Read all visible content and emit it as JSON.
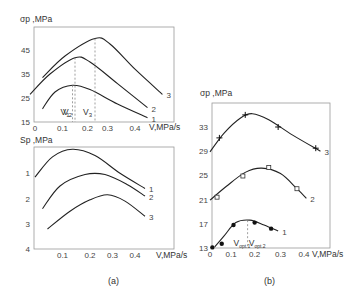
{
  "chart_data": [
    {
      "type": "line",
      "panel": "a-top",
      "ylabel": "σp ,MPa",
      "xlabel": "V,MPa/s",
      "xlim": [
        0,
        0.4
      ],
      "ylim": [
        15,
        45
      ],
      "xticks": [
        "0",
        "0.1",
        "0.2",
        "0.3",
        "0.4"
      ],
      "yticks": [
        "45",
        "35",
        "25",
        "15"
      ],
      "series": [
        {
          "name": "1",
          "points": [
            [
              0.03,
              20.5
            ],
            [
              0.08,
              27.5
            ],
            [
              0.15,
              30.3
            ],
            [
              0.22,
              28.5
            ],
            [
              0.33,
              22.5
            ],
            [
              0.45,
              16.8
            ]
          ]
        },
        {
          "name": "2",
          "points": [
            [
              -0.02,
              26.5
            ],
            [
              0.06,
              35
            ],
            [
              0.16,
              41.8
            ],
            [
              0.22,
              40
            ],
            [
              0.33,
              31
            ],
            [
              0.45,
              21
            ]
          ]
        },
        {
          "name": "3",
          "points": [
            [
              0.03,
              33.5
            ],
            [
              0.12,
              42.5
            ],
            [
              0.24,
              49.8
            ],
            [
              0.3,
              47.5
            ],
            [
              0.4,
              37
            ],
            [
              0.51,
              26.5
            ]
          ]
        }
      ],
      "annotations": [
        {
          "text": "V1",
          "x": 0.13
        },
        {
          "text": "V2",
          "x": 0.21
        },
        {
          "text": "V3",
          "x": 0.25
        }
      ]
    },
    {
      "type": "line",
      "panel": "a-bottom",
      "ylabel": "Sp ,MPa",
      "xlabel": "V,MPa/s",
      "xlim": [
        0,
        0.4
      ],
      "ylim": [
        0,
        4
      ],
      "y_inverted": true,
      "xticks": [
        "0.1",
        "0.2",
        "0.3",
        "0.4"
      ],
      "yticks": [
        "1",
        "2",
        "3",
        "4"
      ],
      "series": [
        {
          "name": "1",
          "points": [
            [
              0.0,
              1.15
            ],
            [
              0.07,
              0.35
            ],
            [
              0.15,
              0.05
            ],
            [
              0.24,
              0.3
            ],
            [
              0.34,
              1.0
            ],
            [
              0.44,
              1.6
            ]
          ]
        },
        {
          "name": "2",
          "points": [
            [
              0.03,
              2.4
            ],
            [
              0.1,
              1.5
            ],
            [
              0.2,
              1.05
            ],
            [
              0.28,
              1.05
            ],
            [
              0.37,
              1.45
            ],
            [
              0.44,
              1.9
            ]
          ]
        },
        {
          "name": "3",
          "points": [
            [
              0.05,
              3.2
            ],
            [
              0.14,
              2.5
            ],
            [
              0.22,
              2.05
            ],
            [
              0.29,
              1.85
            ],
            [
              0.36,
              2.1
            ],
            [
              0.44,
              2.7
            ]
          ]
        }
      ]
    },
    {
      "type": "line",
      "panel": "b",
      "ylabel": "σp ,MPa",
      "xlabel": "V,MPa/s",
      "xlim": [
        0,
        0.5
      ],
      "ylim": [
        13,
        33
      ],
      "xticks": [
        "0",
        "0.1",
        "0.2",
        "0.3",
        "0.4"
      ],
      "yticks": [
        "33",
        "29",
        "25",
        "21",
        "17",
        "13"
      ],
      "series": [
        {
          "name": "1",
          "marker": "filled-circle",
          "points": [
            [
              0.01,
              13.1
            ],
            [
              0.05,
              13.7
            ],
            [
              0.1,
              16.8
            ],
            [
              0.19,
              17.2
            ],
            [
              0.26,
              16.2
            ]
          ],
          "curve": [
            [
              0.02,
              13.2
            ],
            [
              0.06,
              15
            ],
            [
              0.11,
              17.2
            ],
            [
              0.17,
              17.6
            ],
            [
              0.23,
              16.8
            ],
            [
              0.29,
              15.8
            ]
          ]
        },
        {
          "name": "2",
          "marker": "open-square",
          "points": [
            [
              0.03,
              21.4
            ],
            [
              0.14,
              24.9
            ],
            [
              0.25,
              26.3
            ],
            [
              0.37,
              22.8
            ]
          ],
          "curve": [
            [
              0.0,
              20.9
            ],
            [
              0.07,
              23.2
            ],
            [
              0.15,
              25.5
            ],
            [
              0.22,
              26.2
            ],
            [
              0.3,
              25.3
            ],
            [
              0.37,
              22.8
            ],
            [
              0.41,
              21.2
            ]
          ]
        },
        {
          "name": "3",
          "marker": "plus",
          "points": [
            [
              0.04,
              31.2
            ],
            [
              0.15,
              35
            ],
            [
              0.29,
              33
            ],
            [
              0.45,
              29.5
            ]
          ],
          "curve": [
            [
              0.0,
              28.9
            ],
            [
              0.06,
              32
            ],
            [
              0.13,
              34.5
            ],
            [
              0.18,
              35.2
            ],
            [
              0.25,
              34.2
            ],
            [
              0.35,
              31.7
            ],
            [
              0.47,
              29.0
            ]
          ]
        }
      ],
      "annotations": [
        {
          "text": "Vopt.1",
          "x": 0.16
        },
        {
          "text": "Vopt.2",
          "x": 0.22
        }
      ]
    }
  ],
  "captions": {
    "a": "(a)",
    "b": "(b)"
  },
  "labels": {
    "top_ylabel": "σp ,MPa",
    "bot_ylabel": "Sp ,MPa",
    "right_ylabel": "σp ,MPa",
    "xlabel": "V,MPa/s"
  }
}
